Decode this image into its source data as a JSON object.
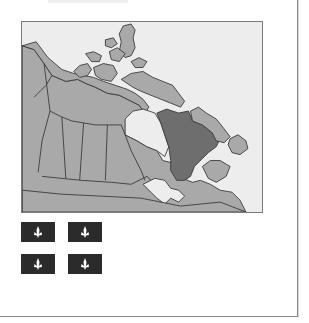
{
  "document": {
    "subject": "Quebec",
    "map": {
      "description": "Map of Canada with Quebec highlighted",
      "highlighted_region": "Quebec",
      "colors": {
        "water": "#ededed",
        "land": "#a9a9a9",
        "highlight": "#6e6e6e",
        "outline": "#3a3a3a"
      }
    },
    "flag": {
      "description": "Flag of Quebec (Fleurdelisé)",
      "field_color": "#2b2b2b",
      "cross_color": "#ffffff",
      "emblem": "fleur-de-lis",
      "emblem_count": 4
    }
  }
}
